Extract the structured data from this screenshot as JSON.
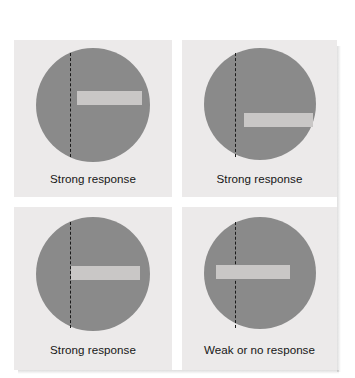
{
  "figure": {
    "type": "orientation-selectivity-stimulus-grid",
    "columns": 2,
    "rows": 2,
    "colors": {
      "page_background": "#ffffff",
      "panel_background": "#eceaea",
      "receptive_field": "#8a8a8a",
      "stimulus_bar": "#c9c7c6",
      "midline": "#1b1b1b",
      "caption_text": "#161616"
    },
    "panels": [
      {
        "id": "top-left",
        "position": "top-left",
        "receptive_field_shape": "circle",
        "midline_style": "vertical dashed",
        "bar_orientation": "horizontal",
        "bar_placement": "right of midline, above center",
        "crosses_midline": false,
        "caption": "Strong response"
      },
      {
        "id": "top-right",
        "position": "top-right",
        "receptive_field_shape": "circle",
        "midline_style": "vertical dashed",
        "bar_orientation": "horizontal",
        "bar_placement": "right of midline, below center",
        "crosses_midline": false,
        "caption": "Strong response"
      },
      {
        "id": "bottom-left",
        "position": "bottom-left",
        "receptive_field_shape": "circle",
        "midline_style": "vertical dashed",
        "bar_orientation": "horizontal",
        "bar_placement": "starting at midline, vertically centered",
        "crosses_midline": false,
        "caption": "Strong response"
      },
      {
        "id": "bottom-right",
        "position": "bottom-right",
        "receptive_field_shape": "circle",
        "midline_style": "vertical dashed",
        "bar_orientation": "horizontal",
        "bar_placement": "straddling the midline, vertically centered",
        "crosses_midline": true,
        "caption": "Weak or no response"
      }
    ]
  }
}
